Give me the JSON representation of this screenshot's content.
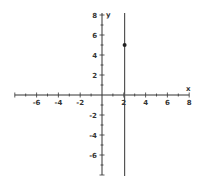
{
  "chart_data": {
    "type": "line",
    "title": "",
    "xlabel": "x",
    "ylabel": "y",
    "xlim": [
      -8,
      8
    ],
    "ylim": [
      -8,
      8
    ],
    "grid": false,
    "x_tick_labels": [
      "-6",
      "-4",
      "-2",
      "2",
      "4",
      "6",
      "8"
    ],
    "y_tick_labels": [
      "8",
      "6",
      "4",
      "2",
      "-2",
      "-4",
      "-6"
    ],
    "series": [
      {
        "name": "vertical line x = 2",
        "type": "line",
        "points": [
          [
            2,
            -8
          ],
          [
            2,
            8
          ]
        ]
      },
      {
        "name": "point",
        "type": "scatter",
        "points": [
          [
            2,
            5
          ]
        ]
      }
    ],
    "colors": {
      "axis": "#333333",
      "line": "#555555",
      "point": "#222222"
    }
  }
}
